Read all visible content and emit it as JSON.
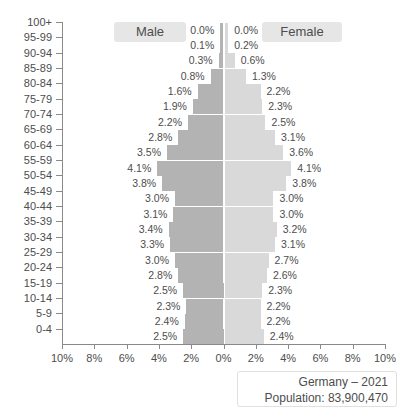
{
  "chart_data": {
    "type": "bar",
    "subtype": "population-pyramid",
    "title": "",
    "xlabel": "",
    "ylabel": "",
    "categories": [
      "100+",
      "95-99",
      "90-94",
      "85-89",
      "80-84",
      "75-79",
      "70-74",
      "65-69",
      "60-64",
      "55-59",
      "50-54",
      "45-49",
      "40-44",
      "35-39",
      "30-34",
      "25-29",
      "20-24",
      "15-19",
      "10-14",
      "5-9",
      "0-4"
    ],
    "series": [
      {
        "name": "Male",
        "side": "left",
        "color": "#b3b3b3",
        "values": [
          0.0,
          0.1,
          0.3,
          0.8,
          1.6,
          1.9,
          2.2,
          2.8,
          3.5,
          4.1,
          3.8,
          3.0,
          3.1,
          3.4,
          3.3,
          3.0,
          2.8,
          2.5,
          2.3,
          2.4,
          2.5
        ],
        "labels": [
          "0.0%",
          "0.1%",
          "0.3%",
          "0.8%",
          "1.6%",
          "1.9%",
          "2.2%",
          "2.8%",
          "3.5%",
          "4.1%",
          "3.8%",
          "3.0%",
          "3.1%",
          "3.4%",
          "3.3%",
          "3.0%",
          "2.8%",
          "2.5%",
          "2.3%",
          "2.4%",
          "2.5%"
        ]
      },
      {
        "name": "Female",
        "side": "right",
        "color": "#d9d9d9",
        "values": [
          0.0,
          0.2,
          0.6,
          1.3,
          2.2,
          2.3,
          2.5,
          3.1,
          3.6,
          4.1,
          3.8,
          3.0,
          3.0,
          3.2,
          3.1,
          2.7,
          2.6,
          2.3,
          2.2,
          2.2,
          2.4
        ],
        "labels": [
          "0.0%",
          "0.2%",
          "0.6%",
          "1.3%",
          "2.2%",
          "2.3%",
          "2.5%",
          "3.1%",
          "3.6%",
          "4.1%",
          "3.8%",
          "3.0%",
          "3.0%",
          "3.2%",
          "3.1%",
          "2.7%",
          "2.6%",
          "2.3%",
          "2.2%",
          "2.2%",
          "2.4%"
        ]
      }
    ],
    "xlim": [
      -10,
      10
    ],
    "xticks": [
      10,
      8,
      6,
      4,
      2,
      0,
      2,
      4,
      6,
      8,
      10
    ],
    "xtick_labels": [
      "10%",
      "8%",
      "6%",
      "4%",
      "2%",
      "0%",
      "2%",
      "4%",
      "6%",
      "8%",
      "10%"
    ],
    "grid": false,
    "legend_position": "top"
  },
  "legend": {
    "male": "Male",
    "female": "Female"
  },
  "footer": {
    "country_year": "Germany – 2021",
    "population": "Population: 83,900,470"
  }
}
